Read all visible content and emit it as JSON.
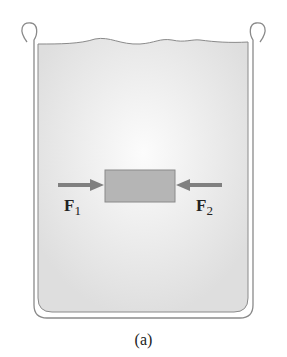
{
  "diagram": {
    "container": "beaker",
    "contents": "liquid",
    "object": "submerged rectangular block",
    "forces": [
      {
        "symbol": "F",
        "subscript": "1",
        "direction": "right",
        "side": "left"
      },
      {
        "symbol": "F",
        "subscript": "2",
        "direction": "left",
        "side": "right"
      }
    ],
    "caption": "(a)"
  },
  "colors": {
    "liquid": "#e4e4e4",
    "liquid_center": "#fafafa",
    "block": "#b5b5b5",
    "arrow": "#808080",
    "outline": "#8a8a8a"
  }
}
